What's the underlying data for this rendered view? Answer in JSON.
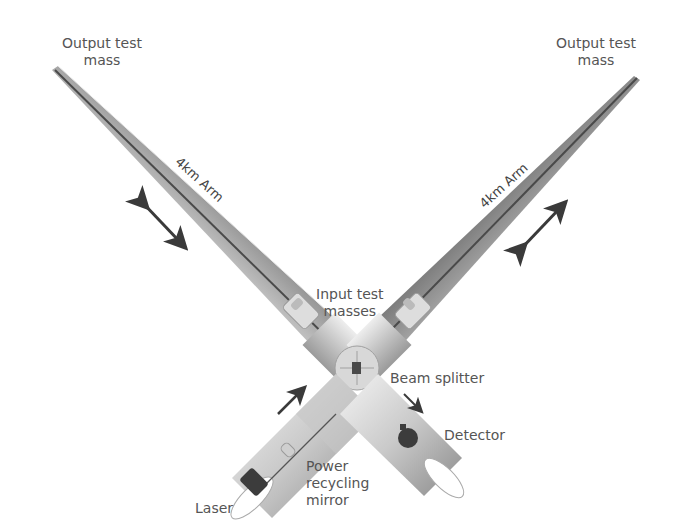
{
  "labels": {
    "output_test_mass_left": [
      "Output test",
      "mass"
    ],
    "output_test_mass_right": [
      "Output test",
      "mass"
    ],
    "arm_left": "4km Arm",
    "arm_right": "4km Arm",
    "input_test_masses": [
      "Input test",
      "masses"
    ],
    "beam_splitter": "Beam splitter",
    "detector": "Detector",
    "power_recycling_mirror": [
      "Power",
      "recycling",
      "mirror"
    ],
    "laser": "Laser"
  },
  "colors": {
    "tube_dark": "#6b6b6b",
    "tube_mid": "#a8a8a8",
    "tube_light": "#e6e6e6",
    "arrow": "#3a3a3a",
    "text": "#555555",
    "component_dark": "#3c3c3c"
  }
}
